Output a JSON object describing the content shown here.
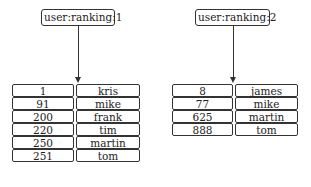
{
  "diagram": {
    "keys": [
      {
        "name": "user:ranking:1",
        "members": [
          {
            "score": "1",
            "member": "kris"
          },
          {
            "score": "91",
            "member": "mike"
          },
          {
            "score": "200",
            "member": "frank"
          },
          {
            "score": "220",
            "member": "tim"
          },
          {
            "score": "250",
            "member": "martin"
          },
          {
            "score": "251",
            "member": "tom"
          }
        ]
      },
      {
        "name": "user:ranking:2",
        "members": [
          {
            "score": "8",
            "member": "james"
          },
          {
            "score": "77",
            "member": "mike"
          },
          {
            "score": "625",
            "member": "martin"
          },
          {
            "score": "888",
            "member": "tom"
          }
        ]
      }
    ],
    "caption": ""
  }
}
